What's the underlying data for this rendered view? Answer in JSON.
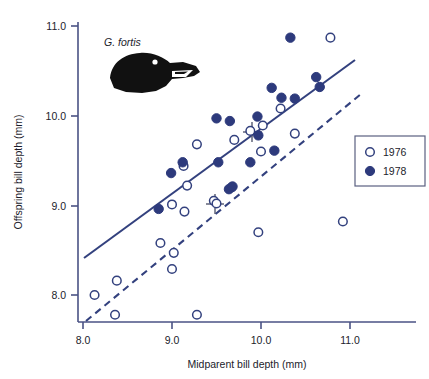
{
  "figure": {
    "species_label": "G. fortis",
    "accent_color": "#33417e",
    "open_marker_color": "#ffffff",
    "filled_marker_color": "#2d3a7c",
    "axis_color": "#4a5284"
  },
  "legend": {
    "position": "right",
    "entries": [
      {
        "label": "1976",
        "marker": "open-circle",
        "color": "#ffffff"
      },
      {
        "label": "1978",
        "marker": "filled-circle",
        "color": "#2d3a7c"
      }
    ]
  },
  "chart_data": {
    "type": "scatter",
    "title": "",
    "xlabel": "Midparent bill depth (mm)",
    "ylabel": "Offspring bill depth (mm)",
    "xlim": [
      7.85,
      11.35
    ],
    "ylim": [
      7.65,
      11.05
    ],
    "xticks": [
      "8.0",
      "9.0",
      "10.0",
      "11.0"
    ],
    "xtick_values": [
      8.0,
      9.0,
      10.0,
      11.0
    ],
    "yticks": [
      "8.0",
      "9.0",
      "10.0",
      "11.0"
    ],
    "ytick_values": [
      8.0,
      9.0,
      10.0,
      11.0
    ],
    "grid": false,
    "series": [
      {
        "name": "1976",
        "marker": "open-circle",
        "points": [
          [
            8.13,
            8.0
          ],
          [
            8.38,
            8.16
          ],
          [
            8.36,
            7.78
          ],
          [
            8.87,
            8.58
          ],
          [
            9.0,
            9.01
          ],
          [
            9.02,
            8.47
          ],
          [
            9.0,
            8.29
          ],
          [
            9.14,
            8.93
          ],
          [
            9.13,
            9.44
          ],
          [
            9.17,
            9.22
          ],
          [
            9.28,
            7.78
          ],
          [
            9.28,
            9.68
          ],
          [
            9.47,
            9.05
          ],
          [
            9.5,
            9.02
          ],
          [
            9.7,
            9.73
          ],
          [
            9.67,
            9.2
          ],
          [
            9.88,
            9.83
          ],
          [
            9.97,
            8.7
          ],
          [
            10.0,
            9.6
          ],
          [
            10.02,
            9.89
          ],
          [
            10.22,
            10.08
          ],
          [
            10.38,
            9.8
          ],
          [
            10.78,
            10.87
          ],
          [
            10.92,
            8.82
          ]
        ]
      },
      {
        "name": "1978",
        "marker": "filled-circle",
        "points": [
          [
            8.85,
            8.96
          ],
          [
            8.99,
            9.36
          ],
          [
            9.12,
            9.48
          ],
          [
            9.5,
            9.97
          ],
          [
            9.52,
            9.48
          ],
          [
            9.65,
            9.94
          ],
          [
            9.64,
            9.18
          ],
          [
            9.68,
            9.21
          ],
          [
            9.88,
            9.48
          ],
          [
            9.96,
            9.99
          ],
          [
            9.97,
            9.78
          ],
          [
            10.12,
            10.31
          ],
          [
            10.15,
            9.61
          ],
          [
            10.23,
            10.2
          ],
          [
            10.33,
            10.87
          ],
          [
            10.38,
            10.19
          ],
          [
            10.62,
            10.43
          ],
          [
            10.66,
            10.32
          ]
        ]
      }
    ],
    "fit_lines": [
      {
        "name": "1978-regression",
        "style": "solid",
        "x_start": 8.02,
        "y_start": 8.46,
        "x_end": 11.06,
        "y_end": 10.67,
        "centroid_marker": {
          "x": 9.9,
          "y": 9.82
        }
      },
      {
        "name": "1976-regression",
        "style": "dashed",
        "x_start": 8.04,
        "y_start": 7.74,
        "x_end": 11.13,
        "y_end": 10.27,
        "centroid_marker": {
          "x": 9.52,
          "y": 9.02
        }
      }
    ],
    "annotations": [
      {
        "text": "G. fortis",
        "x": 8.45,
        "y": 10.78,
        "style": "italic"
      }
    ]
  }
}
